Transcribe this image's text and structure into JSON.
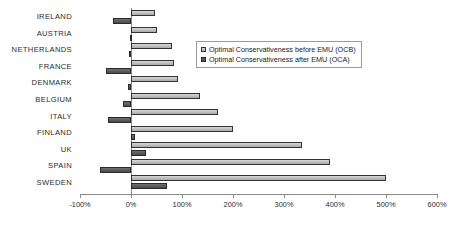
{
  "chart_data": {
    "type": "bar",
    "orientation": "horizontal",
    "title": "",
    "xlabel": "",
    "ylabel": "",
    "xlim": [
      -100,
      600
    ],
    "xticks": [
      -100,
      0,
      100,
      200,
      300,
      400,
      500,
      600
    ],
    "xtick_labels": [
      "-100%",
      "0%",
      "100%",
      "200%",
      "300%",
      "400%",
      "500%",
      "600%"
    ],
    "grid": false,
    "legend_position": "upper-center",
    "categories": [
      "IRELAND",
      "AUSTRIA",
      "NETHERLANDS",
      "FRANCE",
      "DENMARK",
      "BELGIUM",
      "ITALY",
      "FINLAND",
      "UK",
      "SPAIN",
      "SWEDEN"
    ],
    "series": [
      {
        "name": "Optimal Conservativeness before EMU (OCB)",
        "color": "#bdbdbd",
        "values": [
          47,
          50,
          80,
          85,
          92,
          135,
          170,
          200,
          335,
          390,
          500
        ]
      },
      {
        "name": "Optimal Conservativeness after EMU (OCA)",
        "color": "#555555",
        "values": [
          -35,
          -2,
          -3,
          -50,
          -5,
          -15,
          -45,
          8,
          30,
          -60,
          70
        ]
      }
    ]
  },
  "legend": {
    "items": [
      {
        "label": "Optimal Conservativeness before EMU (OCB)",
        "swatch": "ocb"
      },
      {
        "label": "Optimal Conservativeness after EMU (OCA)",
        "swatch": "oca"
      }
    ]
  }
}
